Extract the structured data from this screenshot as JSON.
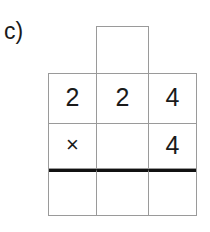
{
  "figure": {
    "part_label": "c)",
    "colors": {
      "grid_line": "#9a9a9a",
      "rule_line": "#111111",
      "text": "#1a1a1a",
      "background": "#ffffff"
    }
  },
  "carry_box": {
    "name": "carry-box",
    "value": "",
    "placeholder": ""
  },
  "grid": {
    "columns": 3,
    "rows": 3,
    "cells": [
      [
        {
          "value": "2",
          "kind": "digit"
        },
        {
          "value": "2",
          "kind": "digit"
        },
        {
          "value": "4",
          "kind": "digit"
        }
      ],
      [
        {
          "value": "×",
          "kind": "operator"
        },
        {
          "value": "",
          "kind": "empty"
        },
        {
          "value": "4",
          "kind": "digit"
        }
      ],
      [
        {
          "value": "",
          "kind": "empty"
        },
        {
          "value": "",
          "kind": "empty"
        },
        {
          "value": "",
          "kind": "empty"
        }
      ]
    ]
  }
}
